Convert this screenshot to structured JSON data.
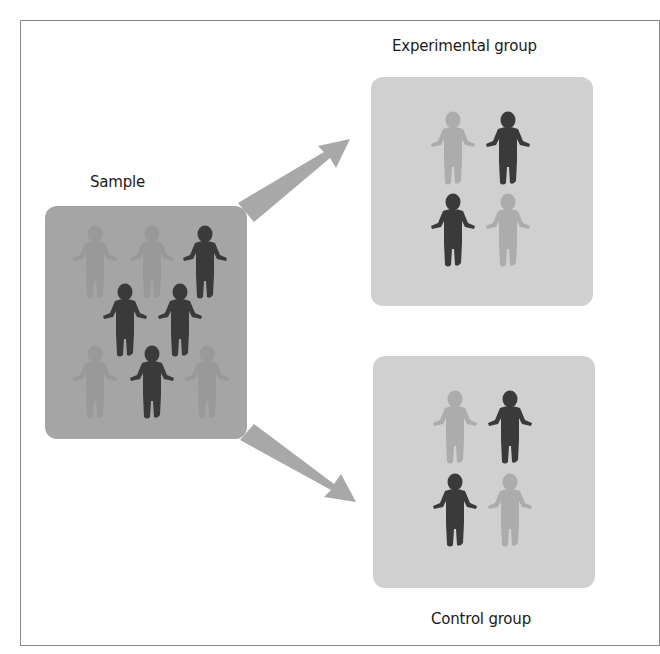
{
  "diagram": {
    "type": "random-assignment",
    "labels": {
      "sample": "Sample",
      "experimental": "Experimental group",
      "control": "Control group"
    },
    "colors": {
      "frame_border": "#8a8a8a",
      "sample_box": "#a5a5a5",
      "group_box": "#d0d0d0",
      "arrow": "#a8a8a8",
      "figure_dark": "#3a3a3a",
      "figure_light_on_sample": "#999999",
      "figure_light_on_group": "#acacac"
    },
    "sample": {
      "figures": [
        {
          "x": 70,
          "y": 225,
          "tone": "light"
        },
        {
          "x": 127,
          "y": 225,
          "tone": "light"
        },
        {
          "x": 180,
          "y": 225,
          "tone": "dark"
        },
        {
          "x": 100,
          "y": 283,
          "tone": "dark"
        },
        {
          "x": 155,
          "y": 283,
          "tone": "dark"
        },
        {
          "x": 70,
          "y": 345,
          "tone": "light"
        },
        {
          "x": 127,
          "y": 345,
          "tone": "dark"
        },
        {
          "x": 182,
          "y": 345,
          "tone": "light"
        }
      ]
    },
    "experimental_group": {
      "figures": [
        {
          "x": 428,
          "y": 111,
          "tone": "light"
        },
        {
          "x": 483,
          "y": 111,
          "tone": "dark"
        },
        {
          "x": 428,
          "y": 193,
          "tone": "dark"
        },
        {
          "x": 483,
          "y": 193,
          "tone": "light"
        }
      ]
    },
    "control_group": {
      "figures": [
        {
          "x": 430,
          "y": 390,
          "tone": "light"
        },
        {
          "x": 485,
          "y": 390,
          "tone": "dark"
        },
        {
          "x": 430,
          "y": 473,
          "tone": "dark"
        },
        {
          "x": 485,
          "y": 473,
          "tone": "light"
        }
      ]
    },
    "arrows": [
      {
        "name": "to-experimental",
        "from": [
          247,
          213
        ],
        "to": [
          348,
          140
        ]
      },
      {
        "name": "to-control",
        "from": [
          247,
          432
        ],
        "to": [
          354,
          500
        ]
      }
    ]
  }
}
